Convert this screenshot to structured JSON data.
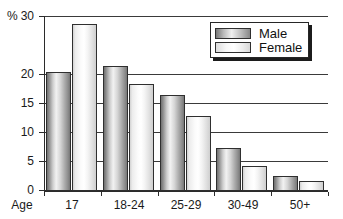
{
  "chart_data": {
    "type": "bar",
    "title": "",
    "subtitle": "",
    "xlabel": "Age",
    "ylabel": "%",
    "categories": [
      "17",
      "18-24",
      "25-29",
      "30-49",
      "50+"
    ],
    "series": [
      {
        "name": "Male",
        "values": [
          20.3,
          21.3,
          16.3,
          7.3,
          2.4
        ]
      },
      {
        "name": "Female",
        "values": [
          28.6,
          18.2,
          12.8,
          4.1,
          1.5
        ]
      }
    ],
    "ylim": [
      0,
      30
    ],
    "ytick_labels": [
      "0",
      "5",
      "10",
      "15",
      "20",
      "30"
    ],
    "ytick_values": [
      0,
      5,
      10,
      15,
      20,
      30
    ],
    "grid": true,
    "grid_axis": "y",
    "legend_position": "top-right",
    "legend_entries": [
      "Male",
      "Female"
    ],
    "axis_origin_label": "Age"
  },
  "axis": {
    "unit_label": "%",
    "origin_label": "Age"
  },
  "legend": {
    "male_label": "Male",
    "female_label": "Female"
  },
  "colors": {
    "axis": "#2b2b2b",
    "grid": "#3a3a3a",
    "male_bar": "#b0b0b0",
    "female_bar": "#f2f2f2",
    "text": "#1a1a1a",
    "background": "#ffffff"
  }
}
